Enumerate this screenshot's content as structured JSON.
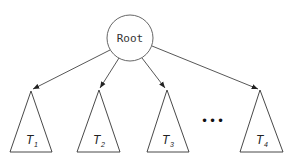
{
  "diagram": {
    "type": "tree",
    "root": {
      "label": "Root",
      "cx": 130,
      "cy": 38,
      "r": 23
    },
    "subtrees": [
      {
        "label": "T",
        "index": "1",
        "apex": [
          31,
          91
        ],
        "base": [
          10,
          52,
          152
        ]
      },
      {
        "label": "T",
        "index": "2",
        "apex": [
          99,
          90
        ],
        "base": [
          77,
          120,
          152
        ]
      },
      {
        "label": "T",
        "index": "3",
        "apex": [
          167,
          90
        ],
        "base": [
          147,
          189,
          152
        ]
      },
      {
        "label": "T",
        "index": "4",
        "apex": [
          260,
          90
        ],
        "base": [
          240,
          283,
          152
        ]
      }
    ],
    "ellipsis": "•••",
    "colors": {
      "stroke": "#333333",
      "background": "#ffffff"
    }
  }
}
